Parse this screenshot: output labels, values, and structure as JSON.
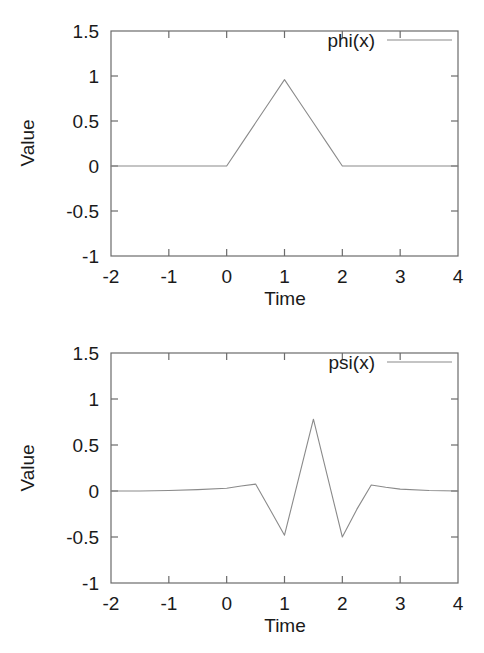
{
  "figure": {
    "background_color": "#ffffff",
    "line_color": "#8a8a8a",
    "frame_color": "#6b6b6b",
    "text_color": "#1a1a1a"
  },
  "chart_data": [
    {
      "type": "line",
      "id": "phi",
      "title": "",
      "xlabel": "Time",
      "ylabel": "Value",
      "xlim": [
        -2,
        4
      ],
      "ylim": [
        -1,
        1.5
      ],
      "xticks": [
        -2,
        -1,
        0,
        1,
        2,
        3,
        4
      ],
      "xtick_labels": [
        "-2",
        "-1",
        "0",
        "1",
        "2",
        "3",
        "4"
      ],
      "yticks": [
        -1,
        -0.5,
        0,
        0.5,
        1,
        1.5
      ],
      "ytick_labels": [
        "-1",
        "-0.5",
        "0",
        "0.5",
        "1",
        "1.5"
      ],
      "grid": false,
      "legend_position": "top-right",
      "series": [
        {
          "name": "phi(x)",
          "x": [
            -2.0,
            -1.5,
            -1.0,
            -0.5,
            0.0,
            0.25,
            0.5,
            0.75,
            1.0,
            1.25,
            1.5,
            1.75,
            2.0,
            2.5,
            3.0,
            3.5,
            4.0
          ],
          "values": [
            0.0,
            0.0,
            0.0,
            0.0,
            0.0,
            0.24,
            0.48,
            0.72,
            0.96,
            0.72,
            0.48,
            0.24,
            0.0,
            0.0,
            0.0,
            0.0,
            0.0
          ]
        }
      ]
    },
    {
      "type": "line",
      "id": "psi",
      "title": "",
      "xlabel": "Time",
      "ylabel": "Value",
      "xlim": [
        -2,
        4
      ],
      "ylim": [
        -1,
        1.5
      ],
      "xticks": [
        -2,
        -1,
        0,
        1,
        2,
        3,
        4
      ],
      "xtick_labels": [
        "-2",
        "-1",
        "0",
        "1",
        "2",
        "3",
        "4"
      ],
      "yticks": [
        -1,
        -0.5,
        0,
        0.5,
        1,
        1.5
      ],
      "ytick_labels": [
        "-1",
        "-0.5",
        "0",
        "0.5",
        "1",
        "1.5"
      ],
      "grid": false,
      "legend_position": "top-right",
      "series": [
        {
          "name": "psi(x)",
          "x": [
            -2.0,
            -1.5,
            -1.0,
            -0.5,
            0.0,
            0.25,
            0.5,
            0.75,
            1.0,
            1.25,
            1.5,
            1.75,
            2.0,
            2.25,
            2.5,
            2.75,
            3.0,
            3.5,
            4.0
          ],
          "values": [
            0.0,
            0.0,
            0.005,
            0.015,
            0.03,
            0.055,
            0.075,
            -0.2,
            -0.48,
            0.15,
            0.78,
            0.14,
            -0.5,
            -0.2,
            0.065,
            0.04,
            0.02,
            0.005,
            0.0
          ]
        }
      ]
    }
  ]
}
